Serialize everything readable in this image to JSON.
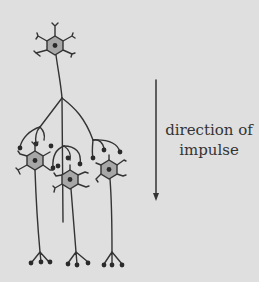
{
  "diagram": {
    "label_line1": "direction of",
    "label_line2": "impulse",
    "colors": {
      "background": "#dfdfdf",
      "line": "#333333",
      "soma_fill": "#a7a7a7",
      "nucleus": "#2a2a2a"
    },
    "nodes": [
      {
        "id": "presynaptic-neuron",
        "role": "top neuron"
      },
      {
        "id": "postsynaptic-neuron-left",
        "role": "left target neuron"
      },
      {
        "id": "postsynaptic-neuron-middle",
        "role": "middle target neuron"
      },
      {
        "id": "postsynaptic-neuron-right",
        "role": "right target neuron"
      }
    ],
    "arrow": {
      "direction": "down"
    }
  }
}
